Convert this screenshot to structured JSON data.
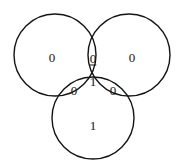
{
  "figure": {
    "type": "venn-diagram",
    "set_count": 3,
    "width": 184,
    "height": 167,
    "background_color": "#ffffff",
    "stroke_color": "#141414",
    "text_color": "#141414"
  },
  "circles": [
    {
      "name": "left-set",
      "cx": 55,
      "cy": 55,
      "r": 41
    },
    {
      "name": "right-set",
      "cx": 129,
      "cy": 55,
      "r": 41
    },
    {
      "name": "bottom-set",
      "cx": 93,
      "cy": 118,
      "r": 41
    }
  ],
  "regions": [
    {
      "name": "left-only",
      "value": "0",
      "x": 52,
      "y": 57,
      "underlined": false
    },
    {
      "name": "right-only",
      "value": "0",
      "x": 132,
      "y": 57,
      "underlined": false
    },
    {
      "name": "left-right-only",
      "value": "0",
      "x": 93,
      "y": 58,
      "underlined": true
    },
    {
      "name": "all-three",
      "value": "1",
      "x": 93,
      "y": 81,
      "underlined": false
    },
    {
      "name": "left-bottom-only",
      "value": "0",
      "x": 74,
      "y": 90,
      "underlined": false
    },
    {
      "name": "right-bottom-only",
      "value": "0",
      "x": 113,
      "y": 90,
      "underlined": false
    },
    {
      "name": "bottom-only",
      "value": "1",
      "x": 93,
      "y": 125,
      "underlined": false
    }
  ]
}
